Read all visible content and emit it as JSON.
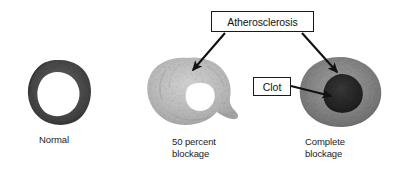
{
  "figure": {
    "type": "medical-illustration",
    "background_color": "#ffffff"
  },
  "callouts": [
    {
      "id": "atherosclerosis",
      "label": "Atherosclerosis",
      "points_to": [
        "50 percent blockage",
        "Complete blockage"
      ]
    },
    {
      "id": "clot",
      "label": "Clot",
      "points_to": [
        "Complete blockage"
      ]
    }
  ],
  "specimens": [
    {
      "id": "normal",
      "caption_line1": "Normal",
      "caption_line2": "",
      "wall_color": "#4a4a4a",
      "lumen_color": "#ffffff",
      "description": "Open round lumen with dark vessel wall"
    },
    {
      "id": "fifty-percent",
      "caption_line1": "50 percent",
      "caption_line2": "blockage",
      "wall_color": "#b8b8b8",
      "lumen_color": "#fdfdfd",
      "description": "Thickened pale wall with narrowed irregular lumen"
    },
    {
      "id": "complete",
      "caption_line1": "Complete",
      "caption_line2": "blockage",
      "wall_color": "#8d8d8d",
      "lumen_color": "#2b2b2b",
      "description": "Lumen filled by dark clot"
    }
  ],
  "colors": {
    "outline": "#1a1a1a",
    "text": "#111111",
    "arrow": "#111111"
  }
}
